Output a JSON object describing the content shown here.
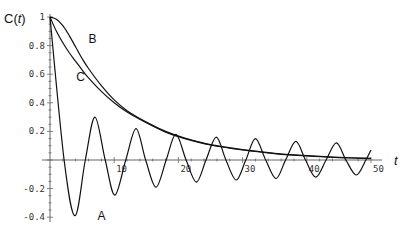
{
  "chart_data": {
    "type": "line",
    "title": "",
    "xlabel": "t",
    "ylabel": "C(t)",
    "xlim": [
      0,
      52
    ],
    "ylim": [
      -0.42,
      1.0
    ],
    "grid": false,
    "legend": "inline labels (A, B, C)",
    "x_ticks": [
      10,
      20,
      30,
      40,
      50
    ],
    "y_ticks": [
      -0.4,
      -0.2,
      0.2,
      0.4,
      0.6,
      0.8,
      1
    ],
    "y_tick_labels": [
      "-0.4",
      "-0.2",
      "0.2",
      "0.4",
      "0.6",
      "0.8",
      "1"
    ],
    "x_tick_labels": [
      "10",
      "20",
      "30",
      "40",
      "50"
    ],
    "series": [
      {
        "name": "A",
        "label_pos": {
          "t": 7.4,
          "C": -0.42
        },
        "t": [
          0,
          2.2,
          3.9,
          5.5,
          7.0,
          8.6,
          10.1,
          11.8,
          13.4,
          14.9,
          16.5,
          18.1,
          19.6,
          21.2,
          22.8,
          24.3,
          25.9,
          27.4,
          29.0,
          30.5,
          32.0,
          33.6,
          35.2,
          36.7,
          38.3,
          39.8,
          41.4,
          43.0,
          44.6,
          46.1,
          47.7,
          49.2,
          50.0
        ],
        "values": [
          1,
          0,
          -0.39,
          0,
          0.3,
          0,
          -0.245,
          0,
          0.22,
          0,
          -0.19,
          0,
          0.18,
          0,
          -0.155,
          0,
          0.16,
          0,
          -0.14,
          0,
          0.15,
          0,
          -0.13,
          0,
          0.13,
          0,
          -0.12,
          0,
          0.12,
          0,
          -0.105,
          0,
          0.07
        ]
      },
      {
        "name": "B",
        "label_pos": {
          "t": 6.0,
          "C": 0.82
        },
        "t": [
          0,
          1,
          2,
          3,
          4,
          5,
          6,
          8,
          10,
          12,
          15,
          18,
          21,
          25,
          30,
          35,
          40,
          45,
          50
        ],
        "values": [
          1,
          0.985,
          0.94,
          0.87,
          0.79,
          0.71,
          0.64,
          0.52,
          0.42,
          0.345,
          0.265,
          0.2,
          0.153,
          0.107,
          0.072,
          0.047,
          0.03,
          0.019,
          0.011
        ]
      },
      {
        "name": "C",
        "label_pos": {
          "t": 4.1,
          "C": 0.55
        },
        "t": [
          0,
          1,
          2,
          3,
          4,
          5,
          6,
          8,
          10,
          12,
          15,
          18,
          21,
          25,
          30,
          35,
          40,
          45,
          50
        ],
        "values": [
          1,
          0.9,
          0.82,
          0.75,
          0.69,
          0.63,
          0.575,
          0.48,
          0.4,
          0.335,
          0.26,
          0.195,
          0.15,
          0.105,
          0.07,
          0.045,
          0.028,
          0.017,
          0.01
        ]
      }
    ]
  },
  "axes": {
    "x_label": "t",
    "y_label_prefix": "C(",
    "y_label_var": "t",
    "y_label_suffix": ")"
  }
}
